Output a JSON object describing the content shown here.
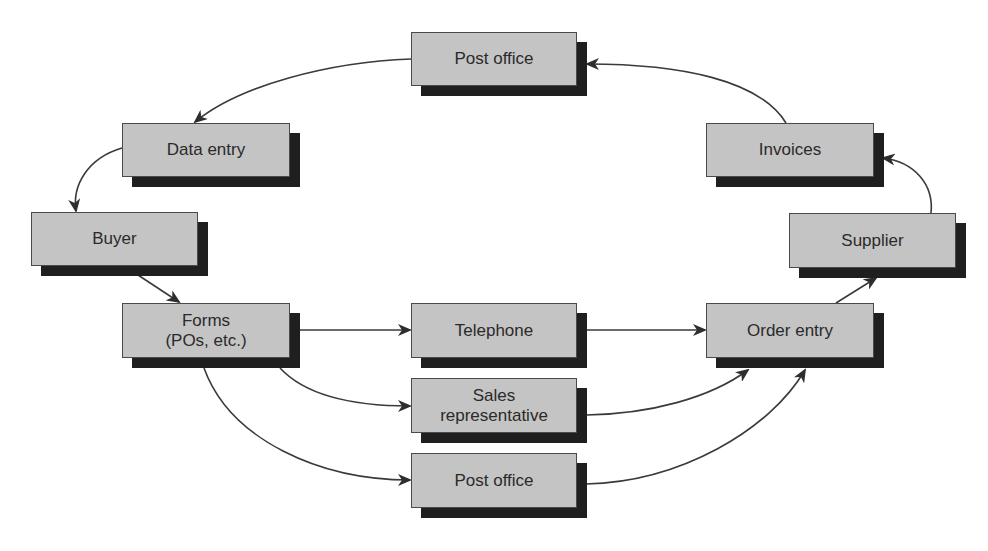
{
  "diagram": {
    "type": "process-flow",
    "nodes": [
      {
        "id": "post_office_top",
        "label": "Post office"
      },
      {
        "id": "data_entry",
        "label": "Data entry"
      },
      {
        "id": "buyer",
        "label": "Buyer"
      },
      {
        "id": "forms",
        "label": "Forms\n(POs, etc.)"
      },
      {
        "id": "telephone",
        "label": "Telephone"
      },
      {
        "id": "sales_rep",
        "label": "Sales\nrepresentative"
      },
      {
        "id": "post_office_bottom",
        "label": "Post office"
      },
      {
        "id": "order_entry",
        "label": "Order entry"
      },
      {
        "id": "supplier",
        "label": "Supplier"
      },
      {
        "id": "invoices",
        "label": "Invoices"
      }
    ],
    "edges": [
      {
        "from": "post_office_top",
        "to": "data_entry"
      },
      {
        "from": "data_entry",
        "to": "buyer"
      },
      {
        "from": "buyer",
        "to": "forms"
      },
      {
        "from": "forms",
        "to": "telephone"
      },
      {
        "from": "forms",
        "to": "sales_rep"
      },
      {
        "from": "forms",
        "to": "post_office_bottom"
      },
      {
        "from": "telephone",
        "to": "order_entry"
      },
      {
        "from": "sales_rep",
        "to": "order_entry"
      },
      {
        "from": "post_office_bottom",
        "to": "order_entry"
      },
      {
        "from": "order_entry",
        "to": "supplier"
      },
      {
        "from": "supplier",
        "to": "invoices"
      },
      {
        "from": "invoices",
        "to": "post_office_top"
      }
    ],
    "colors": {
      "box_fill": "#c4c4c4",
      "box_border": "#4a4a4a",
      "shadow": "#1f1f1f",
      "arrow": "#3a3a3a",
      "text": "#2a2a2a"
    }
  }
}
